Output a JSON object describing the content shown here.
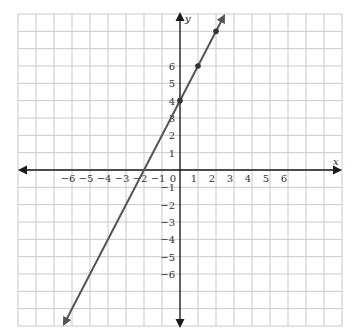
{
  "chart_data": {
    "type": "line",
    "title": "",
    "xlabel": "x",
    "ylabel": "y",
    "xlim": [
      -9,
      9
    ],
    "ylim": [
      -9,
      9
    ],
    "grid": true,
    "x_tick_labels": [
      "−6",
      "−5",
      "−4",
      "−3",
      "−2",
      "−1",
      "0",
      "1",
      "2",
      "3",
      "4",
      "5",
      "6"
    ],
    "x_tick_values": [
      -6,
      -5,
      -4,
      -3,
      -2,
      -1,
      0,
      1,
      2,
      3,
      4,
      5,
      6
    ],
    "y_tick_labels": [
      "6",
      "5",
      "4",
      "3",
      "2",
      "1",
      "−1",
      "−2",
      "−3",
      "−4",
      "−5",
      "−6"
    ],
    "y_tick_values": [
      6,
      5,
      4,
      3,
      2,
      1,
      -1,
      -2,
      -3,
      -4,
      -5,
      -6
    ],
    "series": [
      {
        "name": "y = 2x + 4",
        "slope": 2,
        "intercept": 4,
        "x_intercept": -2,
        "endpoints": [
          {
            "x": -6.5,
            "y": -9
          },
          {
            "x": 2.5,
            "y": 9
          }
        ],
        "arrows": "both",
        "marked_points": [
          {
            "x": 0,
            "y": 4
          },
          {
            "x": 1,
            "y": 6
          },
          {
            "x": 2,
            "y": 8
          }
        ],
        "color": "#555555"
      }
    ]
  },
  "colors": {
    "grid": "#c9c9c9",
    "axes": "#1a1a1a",
    "line": "#555555",
    "background": "#ffffff"
  }
}
